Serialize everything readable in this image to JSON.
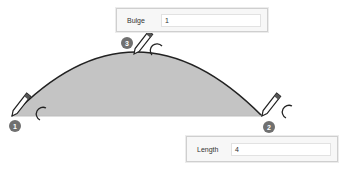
{
  "bulge": {
    "label": "Bulge",
    "value": "1"
  },
  "length": {
    "label": "Length",
    "value": "4"
  },
  "markers": [
    {
      "number": "1"
    },
    {
      "number": "2"
    },
    {
      "number": "3"
    }
  ],
  "colors": {
    "fill": "#c4c4c4",
    "stroke": "#222222",
    "badge": "#707070"
  }
}
